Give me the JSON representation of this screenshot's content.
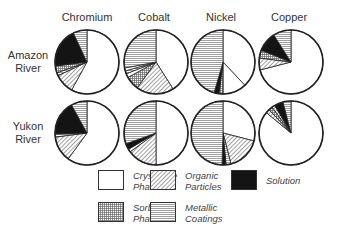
{
  "chart_data": {
    "type": "pie",
    "title": "",
    "columns": [
      "Chromium",
      "Cobalt",
      "Nickel",
      "Copper"
    ],
    "rows": [
      "Amazon River",
      "Yukon River"
    ],
    "row_labels": [
      [
        "Amazon",
        "River"
      ],
      [
        "Yukon",
        "River"
      ]
    ],
    "categories": [
      "Crystalline Phase",
      "Organic Particles",
      "Solution",
      "Sorbed Phase",
      "Metallic Coatings"
    ],
    "legend": [
      {
        "key": "crystalline",
        "line1": "Crystalline",
        "line2": "Phase"
      },
      {
        "key": "organic",
        "line1": "Organic",
        "line2": "Particles"
      },
      {
        "key": "solution",
        "line1": "Solution",
        "line2": ""
      },
      {
        "key": "sorbed",
        "line1": "Sorbed",
        "line2": "Phase"
      },
      {
        "key": "metallic",
        "line1": "Metallic",
        "line2": "Coatings"
      }
    ],
    "note": "Slices listed clockwise from 12 o'clock; values are approximate percentages read from the figure.",
    "pies": [
      {
        "row": "Amazon River",
        "metal": "Chromium",
        "slices": [
          {
            "key": "crystalline",
            "value": 58
          },
          {
            "key": "organic",
            "value": 10
          },
          {
            "key": "metallic",
            "value": 1.5
          },
          {
            "key": "sorbed",
            "value": 3.5
          },
          {
            "key": "solution",
            "value": 20
          },
          {
            "key": "metallic",
            "value": 7
          }
        ]
      },
      {
        "row": "Amazon River",
        "metal": "Cobalt",
        "slices": [
          {
            "key": "crystalline",
            "value": 41
          },
          {
            "key": "organic",
            "value": 19
          },
          {
            "key": "sorbed",
            "value": 7
          },
          {
            "key": "crystalline",
            "value": 2
          },
          {
            "key": "metallic",
            "value": 1.5
          },
          {
            "key": "crystalline",
            "value": 1.5
          },
          {
            "key": "metallic",
            "value": 28
          }
        ]
      },
      {
        "row": "Amazon River",
        "metal": "Nickel",
        "slices": [
          {
            "key": "crystalline",
            "value": 38
          },
          {
            "key": "crystalline",
            "value": 12
          },
          {
            "key": "sorbed",
            "value": 2
          },
          {
            "key": "solution",
            "value": 2.5
          },
          {
            "key": "metallic",
            "value": 45.5
          }
        ]
      },
      {
        "row": "Amazon River",
        "metal": "Copper",
        "slices": [
          {
            "key": "crystalline",
            "value": 71
          },
          {
            "key": "organic",
            "value": 6
          },
          {
            "key": "sorbed",
            "value": 4
          },
          {
            "key": "solution",
            "value": 10
          },
          {
            "key": "metallic",
            "value": 9
          }
        ]
      },
      {
        "row": "Yukon River",
        "metal": "Chromium",
        "slices": [
          {
            "key": "crystalline",
            "value": 60
          },
          {
            "key": "organic",
            "value": 13
          },
          {
            "key": "metallic",
            "value": 1.5
          },
          {
            "key": "solution",
            "value": 17.5
          },
          {
            "key": "metallic",
            "value": 8
          }
        ]
      },
      {
        "row": "Yukon River",
        "metal": "Cobalt",
        "slices": [
          {
            "key": "crystalline",
            "value": 50
          },
          {
            "key": "organic",
            "value": 15
          },
          {
            "key": "crystalline",
            "value": 1.5
          },
          {
            "key": "solution",
            "value": 3
          },
          {
            "key": "metallic",
            "value": 30.5
          }
        ]
      },
      {
        "row": "Yukon River",
        "metal": "Nickel",
        "slices": [
          {
            "key": "crystalline",
            "value": 29
          },
          {
            "key": "organic",
            "value": 17
          },
          {
            "key": "metallic",
            "value": 2.5
          },
          {
            "key": "solution",
            "value": 2
          },
          {
            "key": "metallic",
            "value": 49.5
          }
        ]
      },
      {
        "row": "Yukon River",
        "metal": "Copper",
        "slices": [
          {
            "key": "crystalline",
            "value": 86
          },
          {
            "key": "organic",
            "value": 2
          },
          {
            "key": "sorbed",
            "value": 2
          },
          {
            "key": "organic",
            "value": 1.5
          },
          {
            "key": "solution",
            "value": 4.5
          },
          {
            "key": "metallic",
            "value": 4
          }
        ]
      }
    ]
  },
  "layout": {
    "col_x": [
      87,
      156,
      223,
      291
    ],
    "row_y": [
      62,
      133
    ],
    "radius": 32
  }
}
